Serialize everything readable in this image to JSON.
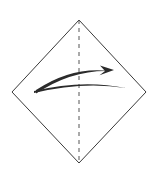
{
  "figure": {
    "title": "Origami fold step diagram",
    "background_color": "#ffffff",
    "width": 154,
    "height": 174
  },
  "paper": {
    "shape_name": "square-rotated-45",
    "label": "Square sheet rotated 45 degrees (diamond orientation)",
    "stroke_color": "#3a3a3a",
    "stroke_width": 1,
    "fill": "none",
    "vertices": [
      {
        "name": "top",
        "x": 79,
        "y": 20
      },
      {
        "name": "right",
        "x": 146,
        "y": 92
      },
      {
        "name": "bottom",
        "x": 79,
        "y": 163
      },
      {
        "name": "left",
        "x": 12,
        "y": 92
      }
    ]
  },
  "crease": {
    "name": "vertical-center-crease",
    "label": "Vertical dashed center fold line",
    "style": "dashed",
    "stroke_color": "#555555",
    "stroke_width": 1,
    "dash_length": 4,
    "gap_length": 4,
    "x": 79,
    "y_start": 20,
    "y_end": 163
  },
  "arrow": {
    "name": "fold-over-arrow",
    "label": "Curved fold-over arrow pointing right",
    "direction": "right",
    "color": "#2b2b2b",
    "upper_arc": {
      "start": {
        "x": 36,
        "y": 90
      },
      "control": {
        "x": 72,
        "y": 66
      },
      "end": {
        "x": 110,
        "y": 71
      }
    },
    "lower_arc": {
      "start": {
        "x": 34,
        "y": 91
      },
      "control": {
        "x": 82,
        "y": 79
      },
      "end": {
        "x": 126,
        "y": 88
      }
    },
    "head": {
      "tip": {
        "x": 114,
        "y": 70
      },
      "width": 10,
      "height": 8
    }
  }
}
